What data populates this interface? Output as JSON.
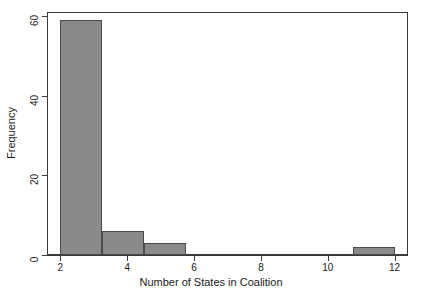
{
  "chart_data": {
    "type": "bar",
    "title": "",
    "subtitle": "",
    "xlabel": "Number of States in Coalition",
    "ylabel": "Frequency",
    "xlim": [
      1.6,
      12.4
    ],
    "ylim": [
      0,
      61
    ],
    "grid": false,
    "legend": null,
    "xticks": [
      2,
      4,
      6,
      8,
      10,
      12
    ],
    "xticklabels": [
      "2",
      "4",
      "6",
      "8",
      "10",
      "12"
    ],
    "yticks": [
      0,
      20,
      40,
      60
    ],
    "yticklabels": [
      "0",
      "20",
      "40",
      "60"
    ],
    "bin_edges": [
      2,
      3.25,
      4.5,
      5.75,
      7,
      8.25,
      9.5,
      10.75,
      12
    ],
    "bins": [
      {
        "left": 2,
        "right": 3.25,
        "value": 59
      },
      {
        "left": 3.25,
        "right": 4.5,
        "value": 6
      },
      {
        "left": 4.5,
        "right": 5.75,
        "value": 3
      },
      {
        "left": 5.75,
        "right": 7,
        "value": 0
      },
      {
        "left": 7,
        "right": 8.25,
        "value": 0
      },
      {
        "left": 8.25,
        "right": 9.5,
        "value": 0
      },
      {
        "left": 9.5,
        "right": 10.75,
        "value": 0
      },
      {
        "left": 10.75,
        "right": 12,
        "value": 2
      }
    ],
    "categories": [
      "2-3.25",
      "3.25-4.5",
      "4.5-5.75",
      "5.75-7",
      "7-8.25",
      "8.25-9.5",
      "9.5-10.75",
      "10.75-12"
    ],
    "values": [
      59,
      6,
      3,
      0,
      0,
      0,
      0,
      2
    ],
    "colors": {
      "bar_fill": "#8a8a8a",
      "bar_edge": "#4a4a4a",
      "axis": "#3a3a3a",
      "text": "#1a1a1a",
      "background": "#ffffff"
    }
  }
}
